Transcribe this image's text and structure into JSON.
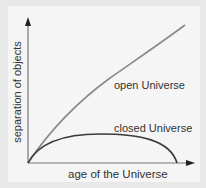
{
  "diagram": {
    "x_axis_label": "age of the Universe",
    "y_axis_label": "separation of objects",
    "curves": [
      {
        "name": "open Universe",
        "label": "open Universe",
        "shape": "rising, slightly concave"
      },
      {
        "name": "closed Universe",
        "label": "closed Universe",
        "shape": "rises, peaks, falls back to zero"
      }
    ],
    "colors": {
      "background": "#e8e8e8",
      "panel": "#f5f5f5",
      "open_curve": "#8a8a8a",
      "closed_curve": "#3a3a3a",
      "axes": "#777777",
      "text": "#333333"
    }
  }
}
